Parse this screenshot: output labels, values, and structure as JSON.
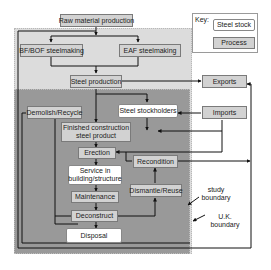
{
  "key": {
    "label": "Key:",
    "steel_stock": "Steel stock",
    "process": "Process"
  },
  "nodes": {
    "raw_material_production": "Raw material production",
    "bf_bof_steelmaking": "BF/BOF steelmaking",
    "eaf_steelmaking": "EAF steelmaking",
    "steel_production": "Steel production",
    "exports": "Exports",
    "imports": "Imports",
    "demolish_recycle": "Demolish/Recycle",
    "steel_stockholders": "Steel stockholders",
    "finished_construction_steel_product_line1": "Finished construction",
    "finished_construction_steel_product_line2": "steel product",
    "erection": "Erection",
    "recondition": "Recondition",
    "service_line1": "Service in",
    "service_line2": "building/structure",
    "dismantle_reuse": "Dismantle/Reuse",
    "maintenance": "Maintenance",
    "deconstruct": "Deconstruct",
    "disposal": "Disposal"
  },
  "annotations": {
    "study_boundary_line1": "study",
    "study_boundary_line2": "boundary",
    "uk_boundary_line1": "U.K.",
    "uk_boundary_line2": "boundary"
  },
  "colors": {
    "uk_region": "#dcdcdc",
    "study_region": "#999999",
    "process_box": "#d2d2d2",
    "stock_box": "#ffffff",
    "line": "#111111"
  }
}
